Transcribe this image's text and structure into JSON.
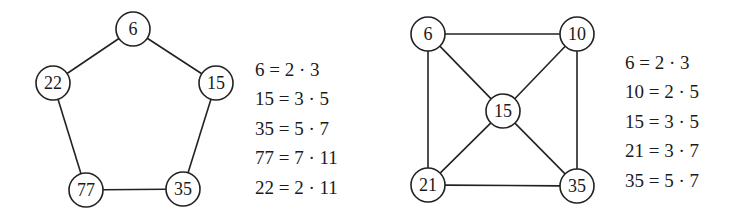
{
  "left_graph": {
    "nodes": [
      {
        "id": "n6",
        "label": "6",
        "x": 133,
        "y": 29
      },
      {
        "id": "n15",
        "label": "15",
        "x": 216,
        "y": 83
      },
      {
        "id": "n35",
        "label": "35",
        "x": 183,
        "y": 189
      },
      {
        "id": "n77",
        "label": "77",
        "x": 86,
        "y": 190
      },
      {
        "id": "n22",
        "label": "22",
        "x": 53,
        "y": 83
      }
    ],
    "edges": [
      [
        "n6",
        "n15"
      ],
      [
        "n15",
        "n35"
      ],
      [
        "n35",
        "n77"
      ],
      [
        "n77",
        "n22"
      ],
      [
        "n22",
        "n6"
      ]
    ],
    "equations": [
      "6 = 2 · 3",
      "15 = 3 · 5",
      "35 = 5 · 7",
      "77 = 7 · 11",
      "22 = 2 · 11"
    ]
  },
  "right_graph": {
    "nodes": [
      {
        "id": "m6",
        "label": "6",
        "x": 428,
        "y": 34
      },
      {
        "id": "m10",
        "label": "10",
        "x": 577,
        "y": 34
      },
      {
        "id": "m15",
        "label": "15",
        "x": 503,
        "y": 111
      },
      {
        "id": "m21",
        "label": "21",
        "x": 428,
        "y": 185
      },
      {
        "id": "m35",
        "label": "35",
        "x": 577,
        "y": 186
      }
    ],
    "edges": [
      [
        "m6",
        "m10"
      ],
      [
        "m6",
        "m21"
      ],
      [
        "m10",
        "m35"
      ],
      [
        "m21",
        "m35"
      ],
      [
        "m6",
        "m15"
      ],
      [
        "m10",
        "m15"
      ],
      [
        "m21",
        "m15"
      ],
      [
        "m35",
        "m15"
      ]
    ],
    "equations": [
      "6 = 2 · 3",
      "10 = 2 · 5",
      "15 = 3 · 5",
      "21 = 3 · 7",
      "35 = 5 · 7"
    ]
  },
  "style": {
    "stroke": "#222222",
    "node_radius": 17
  }
}
